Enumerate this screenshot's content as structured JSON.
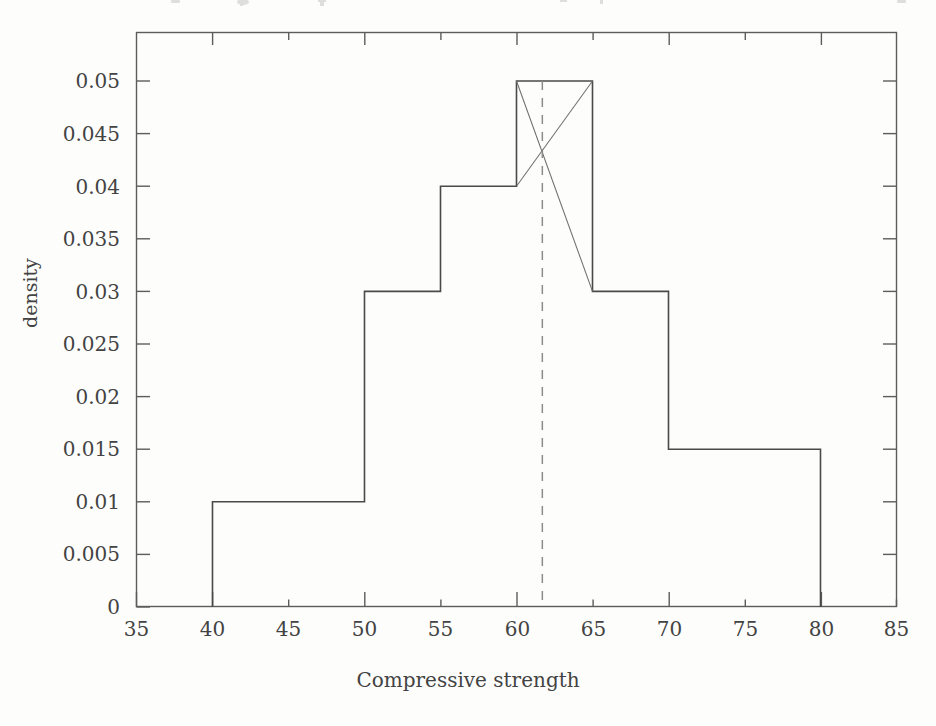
{
  "figure": {
    "background_color": "#fdfdfc",
    "line_color": "#4a4a4a",
    "dashed_line_color": "#8b8b8b",
    "construction_line_color": "#6f6f6f"
  },
  "axes": {
    "x_label": "Compressive strength",
    "y_label": "density",
    "x_ticks": [
      "35",
      "40",
      "45",
      "50",
      "55",
      "60",
      "65",
      "70",
      "75",
      "80",
      "85"
    ],
    "y_ticks": [
      "0",
      "0.005",
      "0.01",
      "0.015",
      "0.02",
      "0.025",
      "0.03",
      "0.035",
      "0.04",
      "0.045",
      "0.05"
    ]
  },
  "chart_data": {
    "type": "bar",
    "title": "",
    "subtitle": "",
    "xlabel": "Compressive strength",
    "ylabel": "density",
    "xlim": [
      35,
      85
    ],
    "ylim": [
      0,
      0.0525
    ],
    "grid": false,
    "legend": "none",
    "bin_edges": [
      40,
      50,
      55,
      60,
      65,
      70,
      80
    ],
    "categories": [
      "40-50",
      "50-55",
      "55-60",
      "60-65",
      "65-70",
      "70-80"
    ],
    "values": [
      0.01,
      0.03,
      0.04,
      0.05,
      0.03,
      0.015
    ],
    "bars": [
      {
        "x0": 40,
        "x1": 50,
        "density": 0.01
      },
      {
        "x0": 50,
        "x1": 55,
        "density": 0.03
      },
      {
        "x0": 55,
        "x1": 60,
        "density": 0.04
      },
      {
        "x0": 60,
        "x1": 65,
        "density": 0.05
      },
      {
        "x0": 65,
        "x1": 70,
        "density": 0.03
      },
      {
        "x0": 70,
        "x1": 80,
        "density": 0.015
      }
    ],
    "annotations": [
      {
        "name": "mode-construction-line-left",
        "type": "segment",
        "from": [
          60,
          0.05
        ],
        "to": [
          65,
          0.03
        ]
      },
      {
        "name": "mode-construction-line-right",
        "type": "segment",
        "from": [
          65,
          0.05
        ],
        "to": [
          60,
          0.04
        ]
      },
      {
        "name": "mode-indicator-dashed-line",
        "type": "vline",
        "x": 61.7,
        "y_from": 0,
        "y_to": 0.05,
        "style": "dashed"
      }
    ],
    "x_tick_values": [
      35,
      40,
      45,
      50,
      55,
      60,
      65,
      70,
      75,
      80,
      85
    ],
    "y_tick_values": [
      0,
      0.005,
      0.01,
      0.015,
      0.02,
      0.025,
      0.03,
      0.035,
      0.04,
      0.045,
      0.05
    ]
  }
}
